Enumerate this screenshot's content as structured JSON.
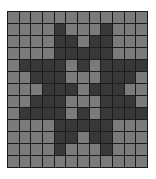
{
  "pattern": {
    "columns": 12,
    "rows": 13,
    "colors": {
      "light": "#7b7b7b",
      "dark": "#383838",
      "gridline": "#1c1c1c",
      "background": "#ffffff"
    },
    "cells": [
      [
        0,
        0,
        0,
        0,
        0,
        0,
        0,
        0,
        0,
        0,
        0,
        0
      ],
      [
        0,
        0,
        0,
        0,
        1,
        0,
        0,
        0,
        1,
        0,
        0,
        0
      ],
      [
        0,
        0,
        0,
        0,
        1,
        1,
        0,
        1,
        1,
        0,
        0,
        0
      ],
      [
        0,
        0,
        0,
        0,
        1,
        1,
        1,
        1,
        1,
        0,
        0,
        0
      ],
      [
        0,
        1,
        1,
        1,
        1,
        0,
        1,
        0,
        1,
        1,
        1,
        1
      ],
      [
        0,
        0,
        1,
        1,
        1,
        0,
        0,
        0,
        1,
        1,
        1,
        0
      ],
      [
        0,
        0,
        0,
        1,
        1,
        1,
        0,
        1,
        1,
        1,
        0,
        0
      ],
      [
        0,
        0,
        1,
        1,
        1,
        0,
        0,
        0,
        1,
        1,
        1,
        0
      ],
      [
        0,
        1,
        1,
        1,
        1,
        0,
        1,
        0,
        1,
        1,
        1,
        1
      ],
      [
        0,
        0,
        0,
        0,
        1,
        1,
        1,
        1,
        1,
        0,
        0,
        0
      ],
      [
        0,
        0,
        0,
        0,
        1,
        1,
        0,
        1,
        1,
        0,
        0,
        0
      ],
      [
        0,
        0,
        0,
        0,
        1,
        0,
        0,
        0,
        1,
        0,
        0,
        0
      ],
      [
        0,
        0,
        0,
        0,
        0,
        0,
        0,
        0,
        0,
        0,
        0,
        0
      ]
    ]
  }
}
